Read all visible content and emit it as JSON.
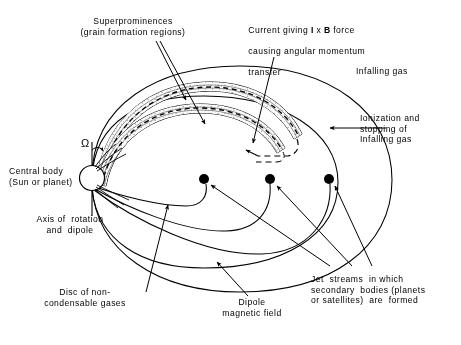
{
  "figure": {
    "background_color": "#ffffff",
    "ink_color": "#000000",
    "stipple_color": "#b4b4b4"
  },
  "labels": {
    "superprominences": "Superprominences\n(grain formation regions)",
    "current_force_line1": "Current giving ",
    "current_force_I": "I",
    "current_force_x": " x ",
    "current_force_B": "B",
    "current_force_line1_tail": " force",
    "current_force_line2": "causing angular momentum",
    "current_force_line3": "transfer",
    "infalling_gas": "Infalling gas",
    "ionization": "Ionization and\nstopping of\nInfalling gas",
    "central_body": "Central body\n(Sun or planet)",
    "axis_of_rotation": "Axis of  rotation\nand  dipole",
    "disc_of_gases": "Disc of non-\ncondensable gases",
    "dipole_field": "Dipole\nmagnetic field",
    "jet_streams": "Jet  streams  in which\nsecondary  bodies (planets\nor satellites)  are  formed",
    "omega_symbol": "Ω"
  },
  "elements": {
    "central_body": {
      "cx": 92,
      "cy": 178,
      "r": 12.5
    },
    "secondary_bodies": [
      {
        "cx": 204,
        "cy": 179,
        "r": 5.0
      },
      {
        "cx": 270,
        "cy": 179,
        "r": 5.0
      },
      {
        "cx": 329,
        "cy": 179,
        "r": 5.0
      }
    ],
    "disc_plane_y": 178,
    "rotation_axis": {
      "x": 92,
      "y1": 142,
      "y2": 216
    },
    "superprominence_band_count": 2,
    "dipole_loop_count": 3,
    "outer_boundary_count": 2
  }
}
